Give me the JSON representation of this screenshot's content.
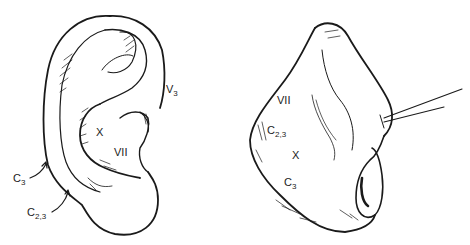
{
  "figure": {
    "ink_color": "#1a1a1a",
    "background": "#ffffff"
  },
  "ear": {
    "labels": [
      {
        "id": "v3",
        "base": "V",
        "sub": "3"
      },
      {
        "id": "x",
        "base": "X",
        "sub": ""
      },
      {
        "id": "vii",
        "base": "VII",
        "sub": ""
      },
      {
        "id": "c3",
        "base": "C",
        "sub": "3"
      },
      {
        "id": "c23",
        "base": "C",
        "sub": "2,3"
      }
    ]
  },
  "nose": {
    "labels": [
      {
        "id": "vii",
        "base": "VII",
        "sub": ""
      },
      {
        "id": "c23",
        "base": "C",
        "sub": "2,3"
      },
      {
        "id": "x",
        "base": "X",
        "sub": ""
      },
      {
        "id": "c3",
        "base": "C",
        "sub": "3"
      }
    ]
  }
}
